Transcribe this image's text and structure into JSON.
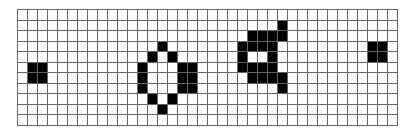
{
  "grid": {
    "cols": 38,
    "rows": 11,
    "cell_width": 10,
    "cell_height": 10.5,
    "line_color": "#666666",
    "empty_color": "#ffffff",
    "filled_color": "#000000",
    "filled_cells": [
      [
        5,
        1
      ],
      [
        5,
        2
      ],
      [
        6,
        1
      ],
      [
        6,
        2
      ],
      [
        3,
        14
      ],
      [
        4,
        13
      ],
      [
        4,
        15
      ],
      [
        5,
        12
      ],
      [
        5,
        16
      ],
      [
        5,
        17
      ],
      [
        6,
        12
      ],
      [
        6,
        16
      ],
      [
        6,
        17
      ],
      [
        7,
        12
      ],
      [
        7,
        16
      ],
      [
        7,
        17
      ],
      [
        8,
        13
      ],
      [
        8,
        15
      ],
      [
        9,
        14
      ],
      [
        1,
        26
      ],
      [
        2,
        23
      ],
      [
        2,
        24
      ],
      [
        2,
        25
      ],
      [
        2,
        26
      ],
      [
        3,
        22
      ],
      [
        3,
        23
      ],
      [
        3,
        24
      ],
      [
        3,
        25
      ],
      [
        4,
        22
      ],
      [
        4,
        25
      ],
      [
        5,
        22
      ],
      [
        5,
        23
      ],
      [
        5,
        24
      ],
      [
        5,
        25
      ],
      [
        6,
        23
      ],
      [
        6,
        24
      ],
      [
        6,
        25
      ],
      [
        6,
        26
      ],
      [
        7,
        26
      ],
      [
        3,
        35
      ],
      [
        3,
        36
      ],
      [
        4,
        35
      ],
      [
        4,
        36
      ]
    ],
    "shapes": [
      {
        "name": "block-left",
        "cells": [
          [
            5,
            1
          ],
          [
            5,
            2
          ],
          [
            6,
            1
          ],
          [
            6,
            2
          ]
        ]
      },
      {
        "name": "diamond-pattern",
        "cells": [
          [
            3,
            14
          ],
          [
            4,
            13
          ],
          [
            4,
            15
          ],
          [
            5,
            12
          ],
          [
            5,
            16
          ],
          [
            5,
            17
          ],
          [
            6,
            12
          ],
          [
            6,
            16
          ],
          [
            6,
            17
          ],
          [
            7,
            12
          ],
          [
            7,
            16
          ],
          [
            7,
            17
          ],
          [
            8,
            13
          ],
          [
            8,
            15
          ],
          [
            9,
            14
          ]
        ]
      },
      {
        "name": "ring-pattern",
        "cells": [
          [
            1,
            26
          ],
          [
            2,
            23
          ],
          [
            2,
            24
          ],
          [
            2,
            25
          ],
          [
            2,
            26
          ],
          [
            3,
            22
          ],
          [
            3,
            23
          ],
          [
            3,
            24
          ],
          [
            3,
            25
          ],
          [
            4,
            22
          ],
          [
            4,
            25
          ],
          [
            5,
            22
          ],
          [
            5,
            23
          ],
          [
            5,
            24
          ],
          [
            5,
            25
          ],
          [
            6,
            23
          ],
          [
            6,
            24
          ],
          [
            6,
            25
          ],
          [
            6,
            26
          ],
          [
            7,
            26
          ]
        ]
      },
      {
        "name": "block-right",
        "cells": [
          [
            3,
            35
          ],
          [
            3,
            36
          ],
          [
            4,
            35
          ],
          [
            4,
            36
          ]
        ]
      }
    ]
  }
}
